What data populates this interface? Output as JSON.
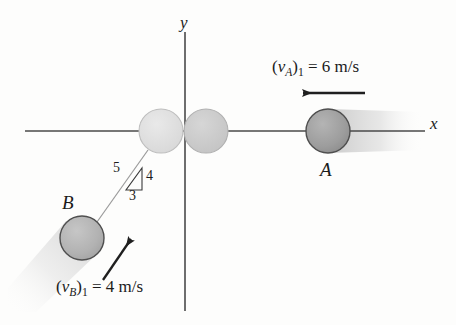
{
  "figure": {
    "type": "physics-impact-diagram",
    "background_color": "#fdfdfc"
  },
  "axes": {
    "x_label": "x",
    "y_label": "y",
    "color": "#4a4a4a",
    "origin": {
      "x": 185,
      "y": 131
    },
    "x_axis": {
      "x1": 25,
      "y1": 131,
      "x2": 425,
      "y2": 131
    },
    "y_axis": {
      "x1": 185,
      "y1": 32,
      "x2": 185,
      "y2": 311
    }
  },
  "balls": {
    "a": {
      "label": "A",
      "center_x": 328,
      "center_y": 131,
      "radius": 22,
      "fill": "#9c9c9c",
      "stroke": "#4f4f4f"
    },
    "b": {
      "label": "B",
      "center_x": 82,
      "center_y": 238,
      "radius": 22,
      "fill": "#b3b3b3",
      "stroke": "#4f4f4f"
    },
    "contact_a": {
      "label": "",
      "center_x": 206,
      "center_y": 131,
      "radius": 22,
      "fill": "#c9c9c9",
      "stroke": "#b0b0b0"
    },
    "contact_b": {
      "label": "",
      "center_x": 161,
      "center_y": 131,
      "radius": 22,
      "fill": "#dedede",
      "stroke": "#bdbdbd"
    }
  },
  "velocities": {
    "a": {
      "symbol": "v",
      "subscript": "A",
      "index": "1",
      "equals": " = ",
      "value": "6 m/s",
      "full_text": "(vA)1 = 6 m/s",
      "arrow_direction": "left",
      "arrow": {
        "x1": 365,
        "y1": 93,
        "x2": 300,
        "y2": 93
      }
    },
    "b": {
      "symbol": "v",
      "subscript": "B",
      "index": "1",
      "equals": " = ",
      "value": "4 m/s",
      "full_text": "(vB)1 = 4 m/s",
      "arrow_direction": "up-right",
      "arrow": {
        "x1": 103,
        "y1": 280,
        "x2": 134,
        "y2": 235
      }
    }
  },
  "slope_triangle": {
    "hypotenuse_label": "5",
    "vertical_label": "4",
    "horizontal_label": "3",
    "ratio": "3-4-5",
    "vertices": {
      "top": {
        "x": 142,
        "y": 168
      },
      "bottom_right": {
        "x": 142,
        "y": 190
      },
      "bottom_left": {
        "x": 126,
        "y": 190
      }
    }
  },
  "motion_path": {
    "description": "line-of-impact path of ball B",
    "x1": 97,
    "y1": 222,
    "x2": 148,
    "y2": 150,
    "color": "#9a9a9a"
  },
  "blur_trails": {
    "a": {
      "color": "#d8d8d8",
      "direction": "right"
    },
    "b": {
      "color": "#e0e0e0",
      "direction": "down-left"
    }
  }
}
